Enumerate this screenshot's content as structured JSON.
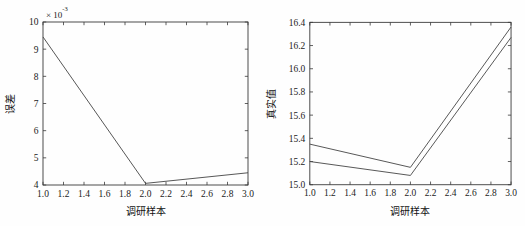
{
  "figure": {
    "background_color": "#fefefe",
    "axis_color": "#3a3a3a",
    "line_color": "#444444",
    "panel_count": 2
  },
  "chart_data": [
    {
      "id": "error-plot",
      "type": "line",
      "title": "",
      "xlabel": "调研样本",
      "ylabel": "误差",
      "exponent_prefix": "× 10",
      "exponent_power": "-3",
      "exponent_label": "× 10⁻³",
      "y_scale_factor": 0.001,
      "xlim": [
        1.0,
        3.0
      ],
      "ylim": [
        4,
        10
      ],
      "grid": false,
      "legend": "none",
      "xticks": [
        "1.0",
        "1.2",
        "1.4",
        "1.6",
        "1.8",
        "2.0",
        "2.2",
        "2.4",
        "2.6",
        "2.8",
        "3.0"
      ],
      "yticks": [
        "4",
        "5",
        "6",
        "7",
        "8",
        "9",
        "10"
      ],
      "x": [
        1.0,
        2.0,
        3.0
      ],
      "series": [
        {
          "name": "误差",
          "values": [
            9.45,
            4.06,
            4.45
          ]
        }
      ]
    },
    {
      "id": "truth-plot",
      "type": "line",
      "title": "",
      "xlabel": "调研样本",
      "ylabel": "真实值",
      "exponent_label": "",
      "xlim": [
        1.0,
        3.0
      ],
      "ylim": [
        15.0,
        16.4
      ],
      "grid": false,
      "legend": "none",
      "xticks": [
        "1.0",
        "1.2",
        "1.4",
        "1.6",
        "1.8",
        "2.0",
        "2.2",
        "2.4",
        "2.6",
        "2.8",
        "3.0"
      ],
      "yticks": [
        "15.0",
        "15.2",
        "15.4",
        "15.6",
        "15.8",
        "16.0",
        "16.2",
        "16.4"
      ],
      "x": [
        1.0,
        2.0,
        3.0
      ],
      "series": [
        {
          "name": "真实值",
          "values": [
            15.35,
            15.15,
            16.36
          ]
        },
        {
          "name": "预测值",
          "values": [
            15.2,
            15.08,
            16.27
          ]
        }
      ]
    }
  ]
}
